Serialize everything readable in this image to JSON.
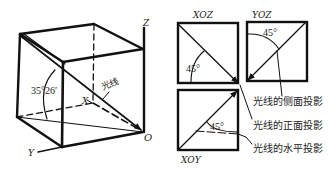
{
  "figure": {
    "cube": {
      "axes": {
        "x": "X",
        "y": "Y",
        "z": "Z",
        "origin": "O"
      },
      "light_label": "光线",
      "angle_label": "35°26′"
    },
    "projections": {
      "front": {
        "title": "XOZ",
        "angle": "45°"
      },
      "side": {
        "title": "YOZ",
        "angle": "45°"
      },
      "horizontal": {
        "title": "XOY",
        "angle": "45°"
      }
    },
    "callouts": [
      {
        "text": "光线的侧面投影"
      },
      {
        "text": "光线的正面投影"
      },
      {
        "text": "光线的水平投影"
      }
    ],
    "colors": {
      "line": "#111111",
      "background": "#ffffff"
    }
  }
}
